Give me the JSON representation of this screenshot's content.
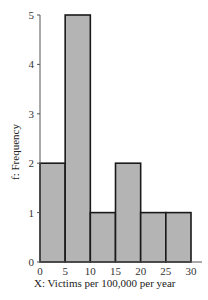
{
  "chart_data": {
    "type": "bar",
    "subtype": "histogram",
    "title": "",
    "xlabel": "X:   Victims per 100,000 per year",
    "ylabel": "f:   Frequency",
    "x_bins": [
      [
        0,
        5
      ],
      [
        5,
        10
      ],
      [
        10,
        15
      ],
      [
        15,
        20
      ],
      [
        20,
        25
      ],
      [
        25,
        30
      ]
    ],
    "categories": [
      "0-5",
      "5-10",
      "10-15",
      "15-20",
      "20-25",
      "25-30"
    ],
    "values": [
      2,
      5,
      1,
      2,
      1,
      1
    ],
    "xlim": [
      0,
      30
    ],
    "ylim": [
      0,
      5
    ],
    "x_ticks": [
      0,
      5,
      10,
      15,
      20,
      25,
      30
    ],
    "y_ticks": [
      0,
      1,
      2,
      3,
      4,
      5
    ],
    "grid": false,
    "legend": null,
    "colors": {
      "bar_fill": "#b4b4b4",
      "bar_edge": "#1a1a1a",
      "axis": "#555555"
    }
  }
}
